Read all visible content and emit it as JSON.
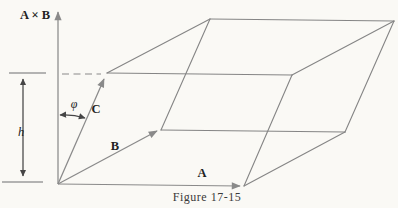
{
  "figure": {
    "caption": "Figure 17-15",
    "labels": {
      "axis": "A × B",
      "height": "h",
      "angle": "φ",
      "vector_a": "A",
      "vector_b": "B",
      "vector_c": "C"
    },
    "colors": {
      "line": "#858585",
      "arrow": "#8a8a8a",
      "dimension": "#454545",
      "label": "#222222",
      "caption": "#3a3a3a",
      "background": "#faf9f5"
    },
    "geometry": {
      "origin": [
        58,
        184
      ],
      "axis_arrow": [
        [
          58,
          184
        ],
        [
          58,
          12
        ]
      ],
      "vector_arrows": {
        "a": [
          [
            58,
            184
          ],
          [
            240,
            186
          ]
        ],
        "b": [
          [
            58,
            184
          ],
          [
            157,
            131
          ]
        ],
        "c": [
          [
            58,
            184
          ],
          [
            104,
            79
          ]
        ]
      },
      "edges": [
        [
          [
            107,
            73
          ],
          [
            210,
            19
          ]
        ],
        [
          [
            210,
            19
          ],
          [
            394,
            21
          ]
        ],
        [
          [
            394,
            21
          ],
          [
            292,
            75
          ]
        ],
        [
          [
            292,
            75
          ],
          [
            107,
            73
          ]
        ],
        [
          [
            161,
            130
          ],
          [
            345,
            132
          ]
        ],
        [
          [
            345,
            132
          ],
          [
            244,
            186
          ]
        ],
        [
          [
            161,
            130
          ],
          [
            210,
            19
          ]
        ],
        [
          [
            244,
            186
          ],
          [
            292,
            75
          ]
        ],
        [
          [
            345,
            132
          ],
          [
            394,
            21
          ]
        ]
      ],
      "dashed_projection": [
        [
          62,
          74
        ],
        [
          101,
          74
        ]
      ],
      "height_ticks": [
        [
          [
            9,
            73
          ],
          [
            46,
            73
          ]
        ],
        [
          [
            2,
            182
          ],
          [
            43,
            182
          ]
        ]
      ],
      "height_arrow": [
        [
          23,
          79
        ],
        [
          23,
          176
        ]
      ],
      "angle_arc": {
        "from": [
          60,
          115
        ],
        "radius": 70,
        "to": [
          85,
          118
        ]
      }
    }
  }
}
